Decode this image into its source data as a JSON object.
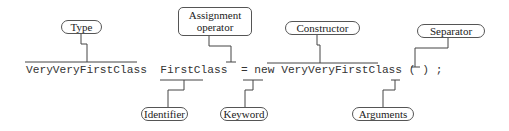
{
  "diagram": {
    "code": {
      "type": "VeryVeryFirstClass",
      "identifier": "FirstClass",
      "assign": "=",
      "keyword": "new",
      "constructor": "VeryVeryFirstClass",
      "args": "( )",
      "separator": ";"
    },
    "labels": {
      "type": "Type",
      "assignment_line1": "Assignment",
      "assignment_line2": "operator",
      "constructor": "Constructor",
      "separator": "Separator",
      "identifier": "Identifier",
      "keyword": "Keyword",
      "arguments": "Arguments"
    },
    "colors": {
      "line": "#444444",
      "text": "#333333",
      "background": "#ffffff"
    }
  }
}
